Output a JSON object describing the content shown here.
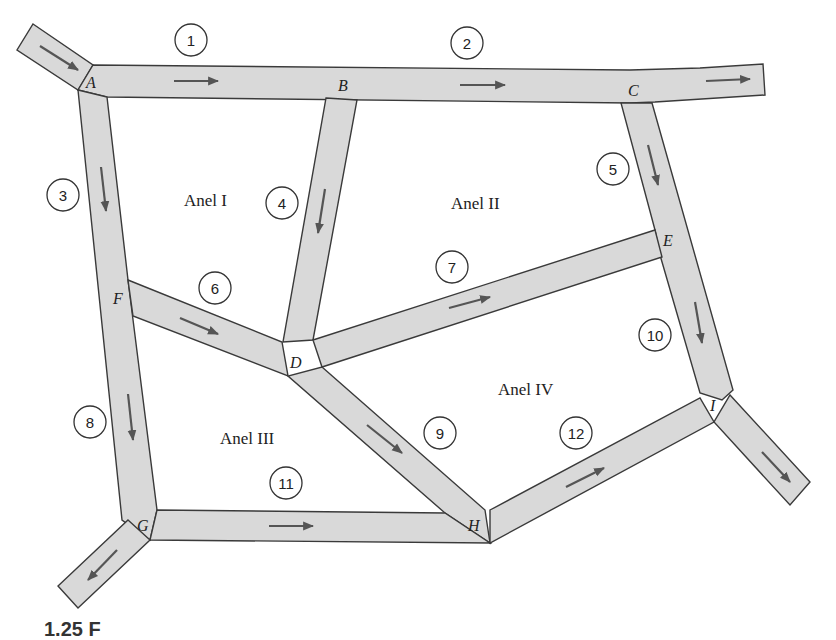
{
  "figure": {
    "type": "traffic-network-diagram",
    "colors": {
      "road_fill": "#d9d9d9",
      "road_stroke": "#3a3a3a",
      "arrow": "#555555",
      "text": "#222222"
    },
    "nodes": [
      {
        "id": "A",
        "label": "A",
        "x": 86,
        "y": 88
      },
      {
        "id": "B",
        "label": "B",
        "x": 342,
        "y": 90
      },
      {
        "id": "C",
        "label": "C",
        "x": 632,
        "y": 95
      },
      {
        "id": "D",
        "label": "D",
        "x": 297,
        "y": 367
      },
      {
        "id": "E",
        "label": "E",
        "x": 668,
        "y": 245
      },
      {
        "id": "F",
        "label": "F",
        "x": 117,
        "y": 303
      },
      {
        "id": "G",
        "label": "G",
        "x": 143,
        "y": 530
      },
      {
        "id": "H",
        "label": "H",
        "x": 475,
        "y": 530
      },
      {
        "id": "I",
        "label": "I",
        "x": 714,
        "y": 410
      }
    ],
    "loops": [
      {
        "id": "loop-1",
        "label": "Anel I",
        "x": 184,
        "y": 206
      },
      {
        "id": "loop-2",
        "label": "Anel II",
        "x": 451,
        "y": 209
      },
      {
        "id": "loop-3",
        "label": "Anel III",
        "x": 220,
        "y": 444
      },
      {
        "id": "loop-4",
        "label": "Anel IV",
        "x": 498,
        "y": 395
      }
    ],
    "edges": [
      {
        "id": "1",
        "label": "1",
        "from": "A",
        "to": "B",
        "cx": 191,
        "cy": 40
      },
      {
        "id": "2",
        "label": "2",
        "from": "B",
        "to": "C",
        "cx": 467,
        "cy": 43
      },
      {
        "id": "3",
        "label": "3",
        "from": "A",
        "to": "F",
        "cx": 63,
        "cy": 195
      },
      {
        "id": "4",
        "label": "4",
        "from": "B",
        "to": "D",
        "cx": 282,
        "cy": 203
      },
      {
        "id": "5",
        "label": "5",
        "from": "C",
        "to": "E",
        "cx": 613,
        "cy": 169
      },
      {
        "id": "6",
        "label": "6",
        "from": "F",
        "to": "D",
        "cx": 215,
        "cy": 288
      },
      {
        "id": "7",
        "label": "7",
        "from": "D",
        "to": "E",
        "cx": 452,
        "cy": 267
      },
      {
        "id": "8",
        "label": "8",
        "from": "F",
        "to": "G",
        "cx": 90,
        "cy": 422
      },
      {
        "id": "9",
        "label": "9",
        "from": "D",
        "to": "H",
        "cx": 440,
        "cy": 433
      },
      {
        "id": "10",
        "label": "10",
        "from": "E",
        "to": "I",
        "cx": 655,
        "cy": 335
      },
      {
        "id": "11",
        "label": "11",
        "from": "G",
        "to": "H",
        "cx": 286,
        "cy": 483
      },
      {
        "id": "12",
        "label": "12",
        "from": "H",
        "to": "I",
        "cx": 576,
        "cy": 433
      }
    ]
  },
  "caption": {
    "text": "1.25 Figura: rede de tráfego (legenda cortada)",
    "visible_fragment": "1.25 F"
  }
}
